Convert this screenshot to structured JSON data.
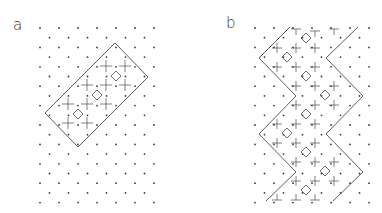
{
  "panels": [
    {
      "id": "a",
      "label": "a",
      "description": "Rotated rectangular unit on triangular dot lattice containing diamonds and crosses"
    },
    {
      "id": "b",
      "label": "b",
      "description": "Zigzag strip on triangular dot lattice containing diamonds and crosses"
    }
  ],
  "colors": {
    "line": "#4a4a4a",
    "dot": "#3a3a3a",
    "background": "#ffffff"
  }
}
